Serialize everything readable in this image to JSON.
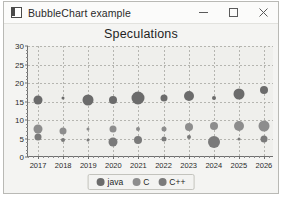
{
  "window": {
    "title": "BubbleChart example",
    "icon": "app-icon",
    "controls": [
      {
        "name": "minimize",
        "glyph": "minimize-icon"
      },
      {
        "name": "maximize",
        "glyph": "maximize-icon"
      },
      {
        "name": "close",
        "glyph": "close-icon"
      }
    ]
  },
  "legend": {
    "position": "bottom-center",
    "items": [
      {
        "label": "java",
        "color": "#6b6b6b"
      },
      {
        "label": "C",
        "color": "#8d8d8d"
      },
      {
        "label": "C++",
        "color": "#7a7a7a"
      }
    ]
  },
  "colors": {
    "plot_background": "#efefec",
    "window_background": "#f4f4f2",
    "axis": "#6f6f6f",
    "grid": "#b5b5b0",
    "java": "#6b6b6b",
    "c": "#8d8d8d",
    "cplusplus": "#7a7a7a"
  },
  "chart_data": {
    "type": "scatter",
    "title": "Speculations",
    "xlabel": "",
    "ylabel": "",
    "xlim": [
      2016.6,
      2026.4
    ],
    "ylim": [
      0,
      30
    ],
    "grid": true,
    "legend_position": "bottom-center",
    "x_ticks": [
      2017,
      2018,
      2019,
      2020,
      2021,
      2022,
      2023,
      2024,
      2025,
      2026
    ],
    "y_ticks": [
      0,
      5,
      10,
      15,
      20,
      25,
      30
    ],
    "series": [
      {
        "name": "java",
        "color": "#6b6b6b",
        "points": [
          {
            "x": 2017,
            "y": 15.5,
            "size": 9
          },
          {
            "x": 2018,
            "y": 16.0,
            "size": 3
          },
          {
            "x": 2019,
            "y": 15.5,
            "size": 11
          },
          {
            "x": 2020,
            "y": 15.5,
            "size": 8
          },
          {
            "x": 2021,
            "y": 16.0,
            "size": 13
          },
          {
            "x": 2022,
            "y": 16.0,
            "size": 7
          },
          {
            "x": 2023,
            "y": 16.5,
            "size": 10
          },
          {
            "x": 2024,
            "y": 16.0,
            "size": 4
          },
          {
            "x": 2025,
            "y": 17.0,
            "size": 11
          },
          {
            "x": 2026,
            "y": 18.0,
            "size": 8
          }
        ]
      },
      {
        "name": "C",
        "color": "#8d8d8d",
        "points": [
          {
            "x": 2017,
            "y": 7.5,
            "size": 9
          },
          {
            "x": 2018,
            "y": 7.0,
            "size": 7
          },
          {
            "x": 2019,
            "y": 7.5,
            "size": 3
          },
          {
            "x": 2020,
            "y": 7.5,
            "size": 7
          },
          {
            "x": 2021,
            "y": 7.5,
            "size": 4
          },
          {
            "x": 2022,
            "y": 7.5,
            "size": 5
          },
          {
            "x": 2023,
            "y": 8.0,
            "size": 8
          },
          {
            "x": 2024,
            "y": 8.5,
            "size": 8
          },
          {
            "x": 2025,
            "y": 8.5,
            "size": 10
          },
          {
            "x": 2026,
            "y": 8.5,
            "size": 11
          }
        ]
      },
      {
        "name": "C++",
        "color": "#7a7a7a",
        "points": [
          {
            "x": 2017,
            "y": 5.5,
            "size": 7
          },
          {
            "x": 2018,
            "y": 4.5,
            "size": 4
          },
          {
            "x": 2019,
            "y": 4.5,
            "size": 3
          },
          {
            "x": 2020,
            "y": 4.0,
            "size": 9
          },
          {
            "x": 2021,
            "y": 4.5,
            "size": 8
          },
          {
            "x": 2022,
            "y": 5.0,
            "size": 5
          },
          {
            "x": 2023,
            "y": 5.5,
            "size": 4
          },
          {
            "x": 2024,
            "y": 4.0,
            "size": 12
          },
          {
            "x": 2025,
            "y": 5.0,
            "size": 3
          },
          {
            "x": 2026,
            "y": 5.0,
            "size": 7
          }
        ]
      }
    ]
  }
}
